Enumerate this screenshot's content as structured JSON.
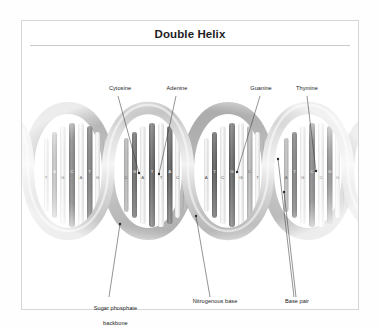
{
  "card": {
    "title": "Double Helix"
  },
  "figure": {
    "alt_name": "dna-double-helix-diagram",
    "turns": 5,
    "ribbon_color": "#b9b9b9",
    "ribbon_shadow": "#8d8d8d",
    "rung_dark": "#5a5a5a",
    "rung_light": "#e8e8e8",
    "leader_color": "#3a3a3a"
  },
  "labels": {
    "top": [
      {
        "id": "cytosine",
        "text": "Cytosine",
        "x": 76,
        "y": 44,
        "w": 44
      },
      {
        "id": "adenine",
        "text": "Adenine",
        "x": 134,
        "y": 44,
        "w": 42
      },
      {
        "id": "guanine",
        "text": "Guanine",
        "x": 218,
        "y": 44,
        "w": 42
      },
      {
        "id": "thymine",
        "text": "Thymine",
        "x": 264,
        "y": 44,
        "w": 42
      }
    ],
    "bottom": [
      {
        "id": "sugar-phosphate-backbone",
        "line1": "Sugar phosphate",
        "line2": "backbone",
        "x": 50,
        "y": 257,
        "w": 74
      },
      {
        "id": "nitrogenous-base",
        "line1": "Nitrogenous base",
        "line2": "",
        "x": 160,
        "y": 257,
        "w": 66
      },
      {
        "id": "base-pair",
        "line1": "Base pair",
        "line2": "",
        "x": 254,
        "y": 257,
        "w": 42
      }
    ]
  },
  "bases": {
    "letters": [
      "A",
      "T",
      "G",
      "C"
    ],
    "sequence_rows": [
      [
        "T",
        "A",
        "G",
        "C",
        "A",
        "T",
        "G",
        "C"
      ],
      [
        "A",
        "T",
        "C",
        "G",
        "T",
        "A",
        "C",
        "G"
      ]
    ]
  }
}
